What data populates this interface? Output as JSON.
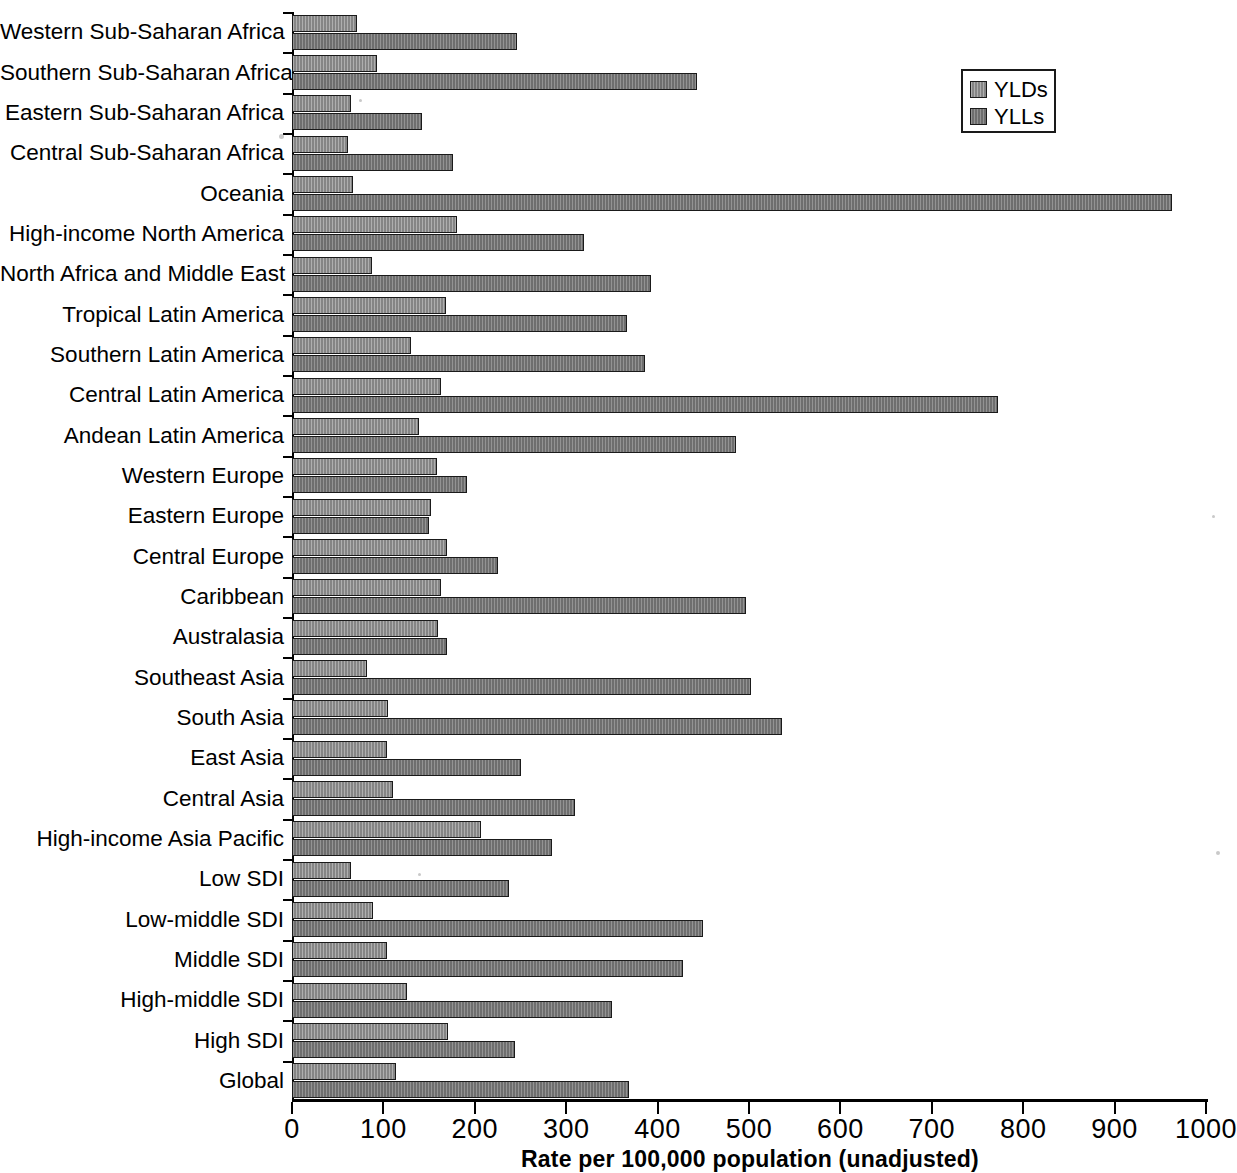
{
  "chart_data": {
    "type": "bar",
    "orientation": "horizontal",
    "title": "",
    "xlabel": "Rate per 100,000 population (unadjusted)",
    "ylabel": "",
    "xlim": [
      0,
      1000
    ],
    "xticks": [
      0,
      100,
      200,
      300,
      400,
      500,
      600,
      700,
      800,
      900,
      1000
    ],
    "xtick_labels": [
      "0",
      "100",
      "200",
      "300",
      "400",
      "500",
      "600",
      "700",
      "800",
      "900",
      "1000"
    ],
    "grid": false,
    "legend_position": "top-right",
    "legend": [
      "YLDs",
      "YLLs"
    ],
    "categories": [
      "Western Sub-Saharan Africa",
      "Southern Sub-Saharan Africa",
      "Eastern Sub-Saharan Africa",
      "Central Sub-Saharan Africa",
      "Oceania",
      "High-income North America",
      "North Africa and Middle East",
      "Tropical Latin America",
      "Southern Latin America",
      "Central Latin America",
      "Andean Latin America",
      "Western Europe",
      "Eastern Europe",
      "Central Europe",
      "Caribbean",
      "Australasia",
      "Southeast Asia",
      "South Asia",
      "East Asia",
      "Central Asia",
      "High-income Asia Pacific",
      "Low SDI",
      "Low-middle SDI",
      "Middle SDI",
      "High-middle SDI",
      "High SDI",
      "Global"
    ],
    "series": [
      {
        "name": "YLDs",
        "color": "#8c8c8c",
        "values": [
          71,
          93,
          65,
          61,
          67,
          180,
          87,
          169,
          130,
          163,
          139,
          159,
          152,
          170,
          163,
          160,
          82,
          105,
          104,
          111,
          207,
          65,
          89,
          104,
          126,
          171,
          114
        ]
      },
      {
        "name": "YLLs",
        "color": "#757575",
        "values": [
          246,
          443,
          142,
          176,
          963,
          320,
          393,
          366,
          386,
          772,
          486,
          192,
          150,
          225,
          497,
          170,
          502,
          536,
          251,
          310,
          284,
          237,
          450,
          428,
          350,
          244,
          369
        ]
      }
    ]
  }
}
